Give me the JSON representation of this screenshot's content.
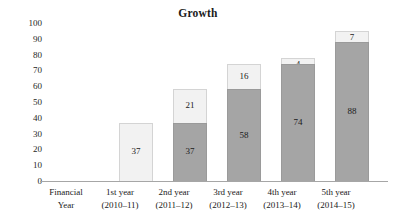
{
  "chart_data": {
    "type": "bar",
    "subtype": "stacked-bar",
    "title": "Growth",
    "xlabel": "",
    "ylabel": "",
    "ylim": [
      0,
      100
    ],
    "yticks": [
      100,
      90,
      80,
      70,
      60,
      50,
      40,
      30,
      20,
      10,
      0
    ],
    "ytick_labels": [
      "100",
      "90",
      "80",
      "70",
      "60",
      "50",
      "40",
      "30",
      "20",
      "10",
      "0"
    ],
    "grid": false,
    "legend": "none",
    "categories": [
      "Financial Year",
      "1st year (2010–11)",
      "2nd year (2011–12)",
      "3rd year (2012–13)",
      "4th year (2013–14)",
      "5th year (2014–15)"
    ],
    "category_lines": [
      {
        "line1": "Financial",
        "line2": "Year"
      },
      {
        "line1": "1st year",
        "line2": "(2010–11)"
      },
      {
        "line1": "2nd year",
        "line2": "(2011–12)"
      },
      {
        "line1": "3rd year",
        "line2": "(2012–13)"
      },
      {
        "line1": "4th year",
        "line2": "(2013–14)"
      },
      {
        "line1": "5th year",
        "line2": "(2014–15)"
      }
    ],
    "series": [
      {
        "name": "base",
        "color": "#a5a5a5",
        "values": [
          null,
          0,
          37,
          58,
          74,
          88
        ]
      },
      {
        "name": "increment",
        "color": "#f2f2f2",
        "values": [
          null,
          37,
          21,
          16,
          4,
          7
        ]
      }
    ],
    "totals": [
      null,
      37,
      58,
      74,
      78,
      95
    ],
    "bars": [
      {
        "category": "Financial Year",
        "has_bar": false,
        "dark": {
          "value": null,
          "label": ""
        },
        "light": {
          "value": null,
          "label": ""
        }
      },
      {
        "category": "1st year (2010–11)",
        "has_bar": true,
        "dark": {
          "value": 0,
          "label": ""
        },
        "light": {
          "value": 37,
          "label": "37"
        },
        "total": 37
      },
      {
        "category": "2nd year (2011–12)",
        "has_bar": true,
        "dark": {
          "value": 37,
          "label": "37"
        },
        "light": {
          "value": 21,
          "label": "21"
        },
        "total": 58
      },
      {
        "category": "3rd year (2012–13)",
        "has_bar": true,
        "dark": {
          "value": 58,
          "label": "58"
        },
        "light": {
          "value": 16,
          "label": "16"
        },
        "total": 74
      },
      {
        "category": "4th year (2013–14)",
        "has_bar": true,
        "dark": {
          "value": 74,
          "label": "74"
        },
        "light": {
          "value": 4,
          "label": "4"
        },
        "total": 78
      },
      {
        "category": "5th year (2014–15)",
        "has_bar": true,
        "dark": {
          "value": 88,
          "label": "88"
        },
        "light": {
          "value": 7,
          "label": "7"
        },
        "total": 95
      }
    ],
    "colors": {
      "dark_segment": "#a5a5a5",
      "light_segment": "#f2f2f2",
      "axis_line": "#a6a6a6",
      "text": "#1a1a1a",
      "background": "#ffffff"
    }
  }
}
